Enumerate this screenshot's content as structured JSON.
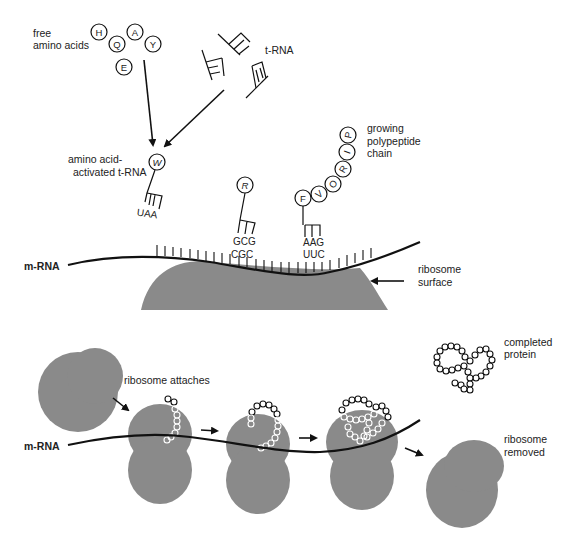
{
  "labels": {
    "free_amino_acids_1": "free",
    "free_amino_acids_2": "amino acids",
    "trna": "t-RNA",
    "activated_1": "amino acid-",
    "activated_2": "activated t-RNA",
    "growing_1": "growing",
    "growing_2": "polypeptide",
    "growing_3": "chain",
    "mrna_top": "m-RNA",
    "ribosome_surface_1": "ribosome",
    "ribosome_surface_2": "surface",
    "ribosome_attaches": "ribosome attaches",
    "mrna_bottom": "m-RNA",
    "completed_1": "completed",
    "completed_2": "protein",
    "removed_1": "ribosome",
    "removed_2": "removed"
  },
  "free_amino_acids": [
    "H",
    "Q",
    "A",
    "Y",
    "E"
  ],
  "activated_trna": {
    "amino_acid": "W",
    "anticodon": "UAA"
  },
  "bound_trna_1": {
    "amino_acid": "R",
    "anticodon": "GCG",
    "codon": "CGC"
  },
  "bound_trna_2": {
    "amino_acid": "F",
    "anticodon": "AAG",
    "codon": "UUC"
  },
  "polypeptide_chain": [
    "V",
    "O",
    "R",
    "I",
    "P"
  ],
  "colors": {
    "ribosome": "#8a8a8a",
    "line": "#111111",
    "background": "#ffffff"
  }
}
